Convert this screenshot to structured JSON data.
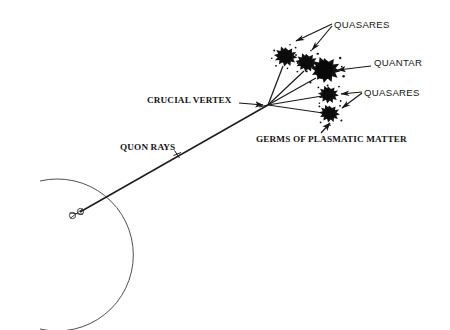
{
  "figure": {
    "kind": "astronomical-schematic-diagram",
    "background_color": "#ffffff",
    "ink_color": "#151515",
    "labels": {
      "quasares_top": "QUASARES",
      "quantar": "QUANTAR",
      "quasares_right": "QUASARES",
      "crucial_vertex": "CRUCIAL VERTEX",
      "quon_rays": "QUON RAYS",
      "germs_of_plasmatic_matter": "GERMS OF PLASMATIC MATTER"
    },
    "geometry": {
      "vertex": {
        "x": 268,
        "y": 105
      },
      "origin_marker": {
        "x": 74,
        "y": 215
      },
      "arc": {
        "cx": 22,
        "cy": 255,
        "r": 76
      },
      "ray_tick": {
        "x": 177,
        "y": 154
      }
    },
    "blobs": [
      {
        "name": "quasar-upper-left",
        "cx": 285,
        "cy": 57,
        "r": 8.5,
        "role": "quasar"
      },
      {
        "name": "quasar-upper-right",
        "cx": 306,
        "cy": 63,
        "r": 8.0,
        "role": "quasar"
      },
      {
        "name": "quantar-core",
        "cx": 324,
        "cy": 72,
        "r": 11.5,
        "role": "quantar"
      },
      {
        "name": "quasar-mid",
        "cx": 328,
        "cy": 95,
        "r": 7.5,
        "role": "quasar"
      },
      {
        "name": "quasar-lower",
        "cx": 329,
        "cy": 114,
        "r": 7.5,
        "role": "quasar"
      }
    ]
  }
}
